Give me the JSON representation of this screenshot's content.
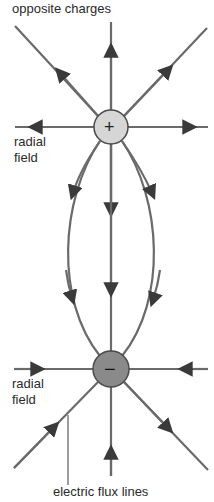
{
  "title": "opposite charges",
  "labels": {
    "radial_top_line1": "radial",
    "radial_top_line2": "field",
    "radial_bottom_line1": "radial",
    "radial_bottom_line2": "field",
    "flux_lines": "electric flux lines"
  },
  "charges": {
    "positive": {
      "symbol": "+",
      "fill": "#d6d6d6"
    },
    "negative": {
      "symbol": "−",
      "fill": "#8a8a8a"
    }
  },
  "colors": {
    "line": "#6a6a6a",
    "arrow": "#3a3a3a",
    "text": "#2a2a2a"
  }
}
